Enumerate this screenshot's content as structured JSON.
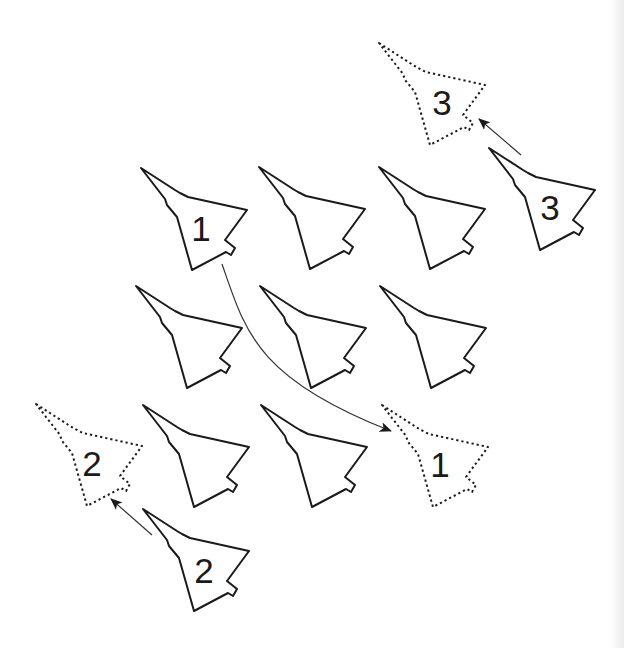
{
  "diagram": {
    "colors": {
      "background": "#ffffff",
      "stroke": "#1a1a1a",
      "arrow": "#333333",
      "label": "#1a1a1a"
    },
    "jet_shape": "delta-wing fighter outline pointing up-left",
    "formation": {
      "rows": [
        {
          "row": 1,
          "jets": [
            {
              "x": 141,
              "y": 168,
              "label": "1"
            },
            {
              "x": 259,
              "y": 167,
              "label": ""
            },
            {
              "x": 379,
              "y": 167,
              "label": ""
            }
          ]
        },
        {
          "row": 2,
          "jets": [
            {
              "x": 136,
              "y": 286,
              "label": ""
            },
            {
              "x": 260,
              "y": 286,
              "label": ""
            },
            {
              "x": 380,
              "y": 286,
              "label": ""
            }
          ]
        },
        {
          "row": 3,
          "jets": [
            {
              "x": 143,
              "y": 405,
              "label": ""
            },
            {
              "x": 261,
              "y": 405,
              "label": ""
            }
          ]
        }
      ]
    },
    "moving_jets": [
      {
        "label": "1",
        "from": {
          "x": 141,
          "y": 168
        },
        "to": {
          "x": 382,
          "y": 405
        },
        "path": "curved"
      },
      {
        "label": "2",
        "from": {
          "x": 143,
          "y": 509
        },
        "to": {
          "x": 36,
          "y": 404
        },
        "path": "straight"
      },
      {
        "label": "3",
        "from": {
          "x": 489,
          "y": 148
        },
        "to": {
          "x": 379,
          "y": 43
        },
        "path": "straight"
      }
    ],
    "labels": {
      "jet1": "1",
      "jet2": "2",
      "jet3": "3",
      "target1": "1",
      "target2": "2",
      "target3": "3"
    }
  }
}
